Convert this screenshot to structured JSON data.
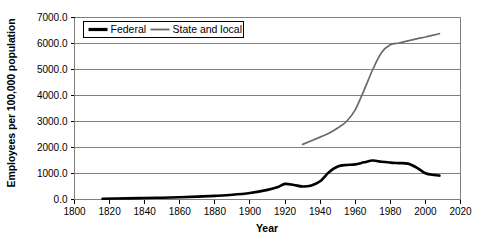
{
  "chart_data": {
    "type": "line",
    "title": "",
    "xlabel": "Year",
    "ylabel": "Employees per 100,000 population",
    "xlim": [
      1800,
      2020
    ],
    "ylim": [
      0,
      7000
    ],
    "xticks": [
      "1800",
      "1820",
      "1840",
      "1860",
      "1880",
      "1900",
      "1920",
      "1940",
      "1960",
      "1980",
      "2000",
      "2020"
    ],
    "yticks": [
      "0.0",
      "1000.0",
      "2000.0",
      "3000.0",
      "4000.0",
      "5000.0",
      "6000.0",
      "7000.0"
    ],
    "grid": "horizontal",
    "legend_position": "top-left-inside",
    "series": [
      {
        "name": "Federal",
        "color": "#000000",
        "x": [
          1816,
          1830,
          1840,
          1850,
          1860,
          1870,
          1880,
          1890,
          1900,
          1910,
          1916,
          1920,
          1925,
          1930,
          1935,
          1940,
          1945,
          1950,
          1955,
          1960,
          1965,
          1970,
          1975,
          1980,
          1985,
          1990,
          1995,
          2000,
          2005,
          2008
        ],
        "y": [
          30,
          45,
          55,
          70,
          85,
          110,
          140,
          180,
          250,
          370,
          480,
          600,
          560,
          500,
          540,
          700,
          1050,
          1270,
          1330,
          1350,
          1430,
          1500,
          1450,
          1420,
          1400,
          1380,
          1230,
          1010,
          940,
          920
        ]
      },
      {
        "name": "State and local",
        "color": "#6b6b6b",
        "x": [
          1930,
          1940,
          1945,
          1950,
          1955,
          1960,
          1965,
          1970,
          1975,
          1980,
          1985,
          1990,
          1995,
          2000,
          2005,
          2008
        ],
        "y": [
          2120,
          2400,
          2550,
          2750,
          3000,
          3450,
          4200,
          5000,
          5650,
          5950,
          6020,
          6100,
          6180,
          6250,
          6330,
          6380
        ]
      }
    ]
  },
  "legend": {
    "items": [
      {
        "label": "Federal"
      },
      {
        "label": "State and local"
      }
    ]
  }
}
